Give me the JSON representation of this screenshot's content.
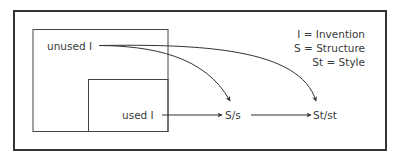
{
  "diagram": {
    "nodes": {
      "unused_invention": "unused I",
      "used_invention": "used I",
      "structure": "S/s",
      "style": "St/st"
    },
    "legend": [
      "I = Invention",
      "S = Structure",
      "St = Style"
    ],
    "edges": [
      {
        "from": "unused I",
        "to": "S/s",
        "type": "curved-arrow"
      },
      {
        "from": "unused I",
        "to": "St/st",
        "type": "curved-arrow"
      },
      {
        "from": "used I",
        "to": "S/s",
        "type": "straight-arrow"
      },
      {
        "from": "S/s",
        "to": "St/st",
        "type": "straight-arrow"
      }
    ],
    "colors": {
      "stroke": "#333333",
      "text": "#3a3a3a",
      "background": "#ffffff"
    }
  }
}
